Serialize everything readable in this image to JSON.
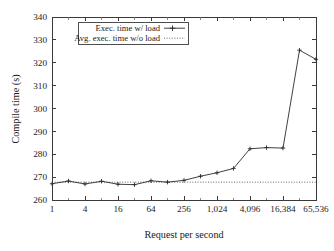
{
  "chart_data": {
    "type": "line",
    "title": "",
    "xlabel": "Request per second",
    "ylabel": "Compile time (s)",
    "xscale": "log4",
    "xlim": [
      1,
      65536
    ],
    "ylim": [
      260,
      340
    ],
    "grid": false,
    "legend_position": "top-center",
    "x_tick_labels": [
      "1",
      "4",
      "16",
      "64",
      "256",
      "1,024",
      "4,096",
      "16,384",
      "65,536"
    ],
    "x_tick_values": [
      1,
      4,
      16,
      64,
      256,
      1024,
      4096,
      16384,
      65536
    ],
    "y_tick_labels": [
      "260",
      "270",
      "280",
      "290",
      "300",
      "310",
      "320",
      "330",
      "340"
    ],
    "y_tick_values": [
      260,
      270,
      280,
      290,
      300,
      310,
      320,
      330,
      340
    ],
    "x": [
      1,
      2,
      4,
      8,
      16,
      32,
      64,
      128,
      256,
      512,
      1024,
      2048,
      4096,
      8192,
      16384,
      32768,
      65536
    ],
    "series": [
      {
        "name": "Exec. time w/ load",
        "style": "solid-with-plus-markers",
        "values": [
          267.1,
          268.3,
          267.0,
          268.2,
          266.9,
          266.7,
          268.4,
          267.8,
          268.6,
          270.4,
          271.9,
          273.8,
          282.4,
          282.9,
          282.7,
          325.5,
          321.5
        ]
      },
      {
        "name": "Avg. exec. time w/o load",
        "style": "dotted-horizontal",
        "constant_value": 267.8
      }
    ]
  },
  "legend": {
    "entries": [
      {
        "label": "Exec. time w/ load",
        "marker": "line-plus"
      },
      {
        "label": "Avg. exec. time w/o load",
        "marker": "dotted-line"
      }
    ]
  },
  "axes": {
    "x_title": "Request per second",
    "y_title": "Compile time (s)"
  },
  "colors": {
    "background": "#ffffff",
    "frame": "#3a3a3a",
    "series_load": "#2b2b2b",
    "series_noload": "#555555",
    "text": "#1a1a1a"
  }
}
